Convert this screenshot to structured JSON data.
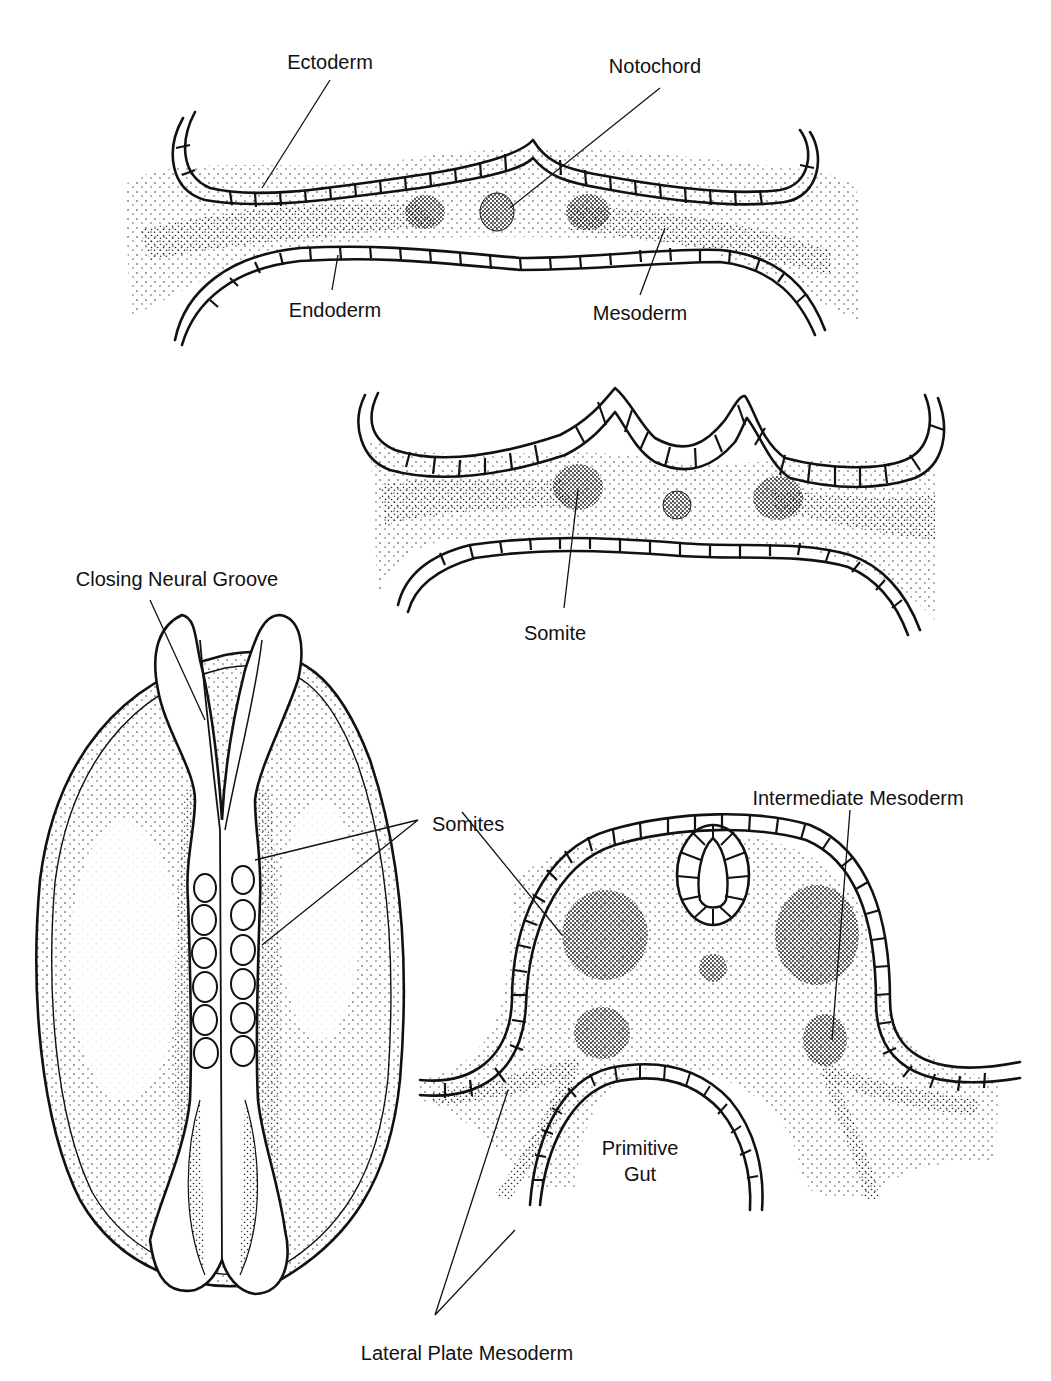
{
  "figure": {
    "colors": {
      "ink": "#111111",
      "background": "#ffffff",
      "stipple": "#333333"
    }
  },
  "panels": [
    {
      "id": "panel-a",
      "description": "Trilaminar embryonic disc cross-section",
      "labels": {
        "ectoderm": "Ectoderm",
        "notochord": "Notochord",
        "endoderm": "Endoderm",
        "mesoderm": "Mesoderm"
      }
    },
    {
      "id": "panel-b",
      "description": "Cross-section showing neural folds and somite formation",
      "labels": {
        "somite": "Somite"
      }
    },
    {
      "id": "panel-c",
      "description": "Dorsal view of embryo with closing neural groove",
      "labels": {
        "closing_neural_groove": "Closing Neural Groove",
        "somites": "Somites"
      }
    },
    {
      "id": "panel-d",
      "description": "Cross-section with neural tube, somites and primitive gut",
      "labels": {
        "intermediate_mesoderm": "Intermediate Mesoderm",
        "primitive_gut_line1": "Primitive",
        "primitive_gut_line2": "Gut",
        "lateral_plate_mesoderm": "Lateral Plate Mesoderm"
      }
    }
  ]
}
